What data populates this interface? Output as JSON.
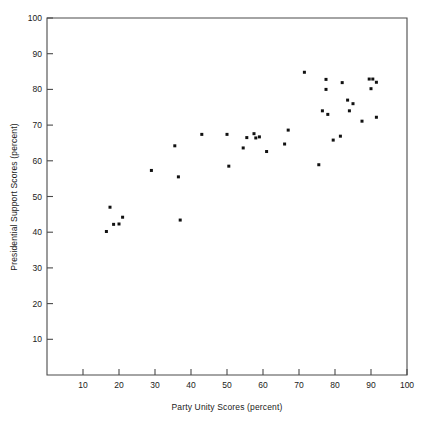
{
  "chart_data": {
    "type": "scatter",
    "title": "",
    "xlabel": "Party Unity Scores (percent)",
    "ylabel": "Presidential Support Scores (percent)",
    "xlim": [
      0,
      100
    ],
    "ylim": [
      0,
      100
    ],
    "xticks": [
      10,
      20,
      30,
      40,
      50,
      60,
      70,
      80,
      90,
      100
    ],
    "yticks": [
      10,
      20,
      30,
      40,
      50,
      60,
      70,
      80,
      90,
      100
    ],
    "xtick_labels": [
      "10",
      "20",
      "30",
      "40",
      "50",
      "60",
      "70",
      "80",
      "90",
      "100"
    ],
    "ytick_labels": [
      "10",
      "20",
      "30",
      "40",
      "50",
      "60",
      "70",
      "80",
      "90",
      "100"
    ],
    "grid": false,
    "legend": null,
    "marker": "filled-square",
    "marker_color": "#111111",
    "marker_size": 3,
    "frame_color": "#4a4a4a",
    "background_color": "#ffffff",
    "n_points": 44,
    "x": [
      16.5,
      17.5,
      18.5,
      20.0,
      21.0,
      29.0,
      35.5,
      36.5,
      43.0,
      50.0,
      50.5,
      54.5,
      55.5,
      57.5,
      58.0,
      59.0,
      61.0,
      66.0,
      67.0,
      71.5,
      75.5,
      76.5,
      77.5,
      77.5,
      78.0,
      79.5,
      81.5,
      82.0,
      83.5,
      84.0,
      85.0,
      87.5,
      89.5,
      90.0,
      90.5,
      91.5
    ],
    "y": [
      40.2,
      47.0,
      42.2,
      42.3,
      44.2,
      57.3,
      64.2,
      55.5,
      67.4,
      67.4,
      58.5,
      63.6,
      66.5,
      67.6,
      66.4,
      66.7,
      62.6,
      64.7,
      68.6,
      84.8,
      58.9,
      74.0,
      82.8,
      80.0,
      73.0,
      65.8,
      66.9,
      81.9,
      77.0,
      74.0,
      76.0,
      71.1,
      82.9,
      80.2,
      82.9,
      82.0
    ],
    "points": [
      {
        "x": 16.5,
        "y": 40.2
      },
      {
        "x": 17.5,
        "y": 47.0
      },
      {
        "x": 18.5,
        "y": 42.2
      },
      {
        "x": 20.0,
        "y": 42.3
      },
      {
        "x": 21.0,
        "y": 44.2
      },
      {
        "x": 29.0,
        "y": 57.3
      },
      {
        "x": 35.5,
        "y": 64.2
      },
      {
        "x": 36.5,
        "y": 55.5
      },
      {
        "x": 37.0,
        "y": 43.4
      },
      {
        "x": 43.0,
        "y": 67.4
      },
      {
        "x": 50.0,
        "y": 67.4
      },
      {
        "x": 50.5,
        "y": 58.5
      },
      {
        "x": 54.5,
        "y": 63.6
      },
      {
        "x": 55.5,
        "y": 66.5
      },
      {
        "x": 57.5,
        "y": 67.6
      },
      {
        "x": 58.0,
        "y": 66.4
      },
      {
        "x": 59.0,
        "y": 66.7
      },
      {
        "x": 61.0,
        "y": 62.6
      },
      {
        "x": 66.0,
        "y": 64.7
      },
      {
        "x": 67.0,
        "y": 68.6
      },
      {
        "x": 71.5,
        "y": 84.8
      },
      {
        "x": 75.5,
        "y": 58.9
      },
      {
        "x": 76.5,
        "y": 74.0
      },
      {
        "x": 77.5,
        "y": 82.8
      },
      {
        "x": 77.5,
        "y": 80.0
      },
      {
        "x": 78.0,
        "y": 73.0
      },
      {
        "x": 79.5,
        "y": 65.8
      },
      {
        "x": 81.5,
        "y": 66.9
      },
      {
        "x": 82.0,
        "y": 81.9
      },
      {
        "x": 83.5,
        "y": 77.0
      },
      {
        "x": 84.0,
        "y": 74.0
      },
      {
        "x": 85.0,
        "y": 76.0
      },
      {
        "x": 87.5,
        "y": 71.1
      },
      {
        "x": 89.5,
        "y": 82.9
      },
      {
        "x": 90.0,
        "y": 80.2
      },
      {
        "x": 90.5,
        "y": 82.9
      },
      {
        "x": 91.5,
        "y": 82.0
      },
      {
        "x": 91.5,
        "y": 72.2
      }
    ]
  }
}
